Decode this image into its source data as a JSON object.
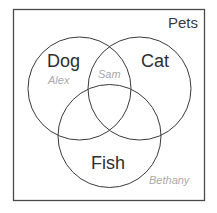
{
  "diagram": {
    "type": "venn",
    "universe": {
      "label": "Pets"
    },
    "sets": [
      {
        "id": "dog",
        "label": "Dog"
      },
      {
        "id": "cat",
        "label": "Cat"
      },
      {
        "id": "fish",
        "label": "Fish"
      }
    ],
    "members": [
      {
        "name": "Alex",
        "region": "Dog only"
      },
      {
        "name": "Sam",
        "region": "Dog ∩ Cat"
      },
      {
        "name": "Bethany",
        "region": "Pets (outside all sets)"
      }
    ],
    "colors": {
      "stroke": "#3a3a3a",
      "set_label": "#2e2e2e",
      "member_label": "#a9a9a9",
      "background": "#ffffff"
    }
  }
}
